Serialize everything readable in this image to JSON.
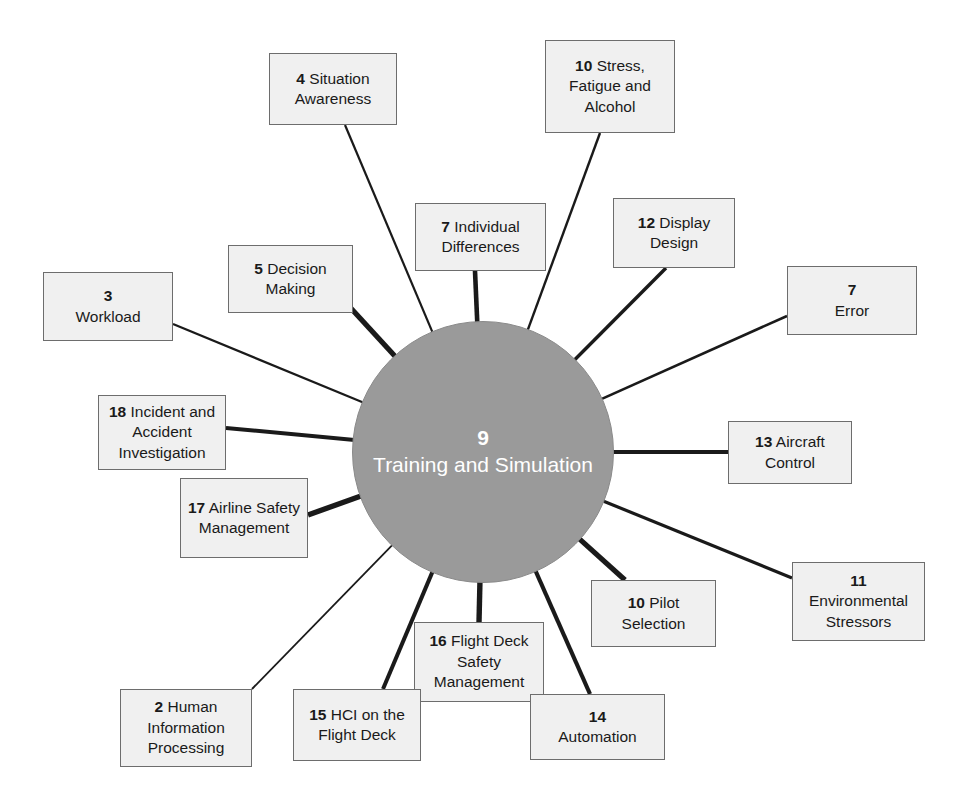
{
  "diagram": {
    "type": "radial-hub-and-spoke",
    "canvas": {
      "width": 964,
      "height": 811
    },
    "colors": {
      "hub_fill": "#9a9a9a",
      "hub_text": "#ffffff",
      "node_fill": "#f0f0f0",
      "node_border": "#6d6d6d",
      "edge": "#1a1a1a",
      "background": "#ffffff"
    },
    "hub": {
      "number": "9",
      "label": "Training and Simulation",
      "cx": 483,
      "cy": 452,
      "r": 131
    },
    "nodes": [
      {
        "id": "situation-awareness",
        "number": "4",
        "label": "Situation Awareness",
        "number_inline": true,
        "x": 269,
        "y": 53,
        "w": 128,
        "h": 72,
        "anchor_x": 345,
        "anchor_y": 125,
        "edge_width": 2.2
      },
      {
        "id": "stress-fatigue-alcohol",
        "number": "10",
        "label": "Stress, Fatigue and Alcohol",
        "number_inline": true,
        "x": 545,
        "y": 40,
        "w": 130,
        "h": 93,
        "anchor_x": 600,
        "anchor_y": 133,
        "edge_width": 2.4
      },
      {
        "id": "individual-differences",
        "number": "7",
        "label": "Individual Differences",
        "number_inline": true,
        "x": 415,
        "y": 203,
        "w": 131,
        "h": 68,
        "anchor_x": 475,
        "anchor_y": 271,
        "edge_width": 4.6
      },
      {
        "id": "display-design",
        "number": "12",
        "label": "Display Design",
        "number_inline": true,
        "x": 613,
        "y": 198,
        "w": 122,
        "h": 70,
        "anchor_x": 666,
        "anchor_y": 268,
        "edge_width": 3.4
      },
      {
        "id": "decision-making",
        "number": "5",
        "label": "Decision Making",
        "number_inline": true,
        "x": 228,
        "y": 245,
        "w": 125,
        "h": 68,
        "anchor_x": 336,
        "anchor_y": 292,
        "edge_width": 5.2
      },
      {
        "id": "workload",
        "number": "3",
        "label": "Workload",
        "number_inline": false,
        "x": 43,
        "y": 272,
        "w": 130,
        "h": 69,
        "anchor_x": 173,
        "anchor_y": 324,
        "edge_width": 2.2
      },
      {
        "id": "error",
        "number": "7",
        "label": "Error",
        "number_inline": false,
        "x": 787,
        "y": 266,
        "w": 130,
        "h": 69,
        "anchor_x": 787,
        "anchor_y": 316,
        "edge_width": 2.6
      },
      {
        "id": "incident-accident-investigation",
        "number": "18",
        "label": "Incident and Accident Investigation",
        "number_inline": true,
        "x": 98,
        "y": 395,
        "w": 128,
        "h": 75,
        "anchor_x": 226,
        "anchor_y": 428,
        "edge_width": 4.0
      },
      {
        "id": "aircraft-control",
        "number": "13",
        "label": "Aircraft Control",
        "number_inline": true,
        "x": 728,
        "y": 421,
        "w": 124,
        "h": 63,
        "anchor_x": 728,
        "anchor_y": 452,
        "edge_width": 3.8
      },
      {
        "id": "airline-safety-management",
        "number": "17",
        "label": "Airline Safety Management",
        "number_inline": true,
        "x": 180,
        "y": 478,
        "w": 128,
        "h": 80,
        "anchor_x": 308,
        "anchor_y": 515,
        "edge_width": 5.4
      },
      {
        "id": "environmental-stressors",
        "number": "11",
        "label": "Environmental Stressors",
        "number_inline": false,
        "x": 792,
        "y": 562,
        "w": 133,
        "h": 79,
        "anchor_x": 792,
        "anchor_y": 578,
        "edge_width": 3.2
      },
      {
        "id": "pilot-selection",
        "number": "10",
        "label": "Pilot Selection",
        "number_inline": true,
        "x": 591,
        "y": 580,
        "w": 125,
        "h": 67,
        "anchor_x": 625,
        "anchor_y": 580,
        "edge_width": 5.2
      },
      {
        "id": "flight-deck-safety-management",
        "number": "16",
        "label": "Flight Deck Safety Management",
        "number_inline": true,
        "x": 414,
        "y": 622,
        "w": 130,
        "h": 80,
        "anchor_x": 479,
        "anchor_y": 622,
        "edge_width": 5.4
      },
      {
        "id": "automation",
        "number": "14",
        "label": "Automation",
        "number_inline": false,
        "x": 530,
        "y": 694,
        "w": 135,
        "h": 66,
        "anchor_x": 590,
        "anchor_y": 694,
        "edge_width": 4.2
      },
      {
        "id": "hci-flight-deck",
        "number": "15",
        "label": "HCI on the Flight Deck",
        "number_inline": true,
        "x": 293,
        "y": 689,
        "w": 128,
        "h": 72,
        "anchor_x": 383,
        "anchor_y": 689,
        "edge_width": 4.0
      },
      {
        "id": "human-information-processing",
        "number": "2",
        "label": "Human Information Processing",
        "number_inline": true,
        "x": 120,
        "y": 689,
        "w": 132,
        "h": 78,
        "anchor_x": 252,
        "anchor_y": 689,
        "edge_width": 1.8
      }
    ]
  }
}
